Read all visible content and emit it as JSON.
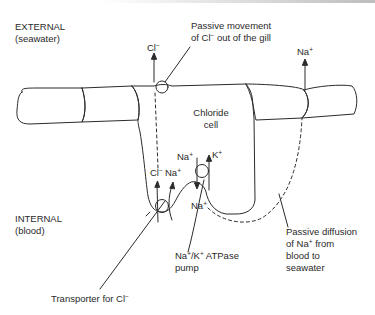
{
  "regions": {
    "external": {
      "title": "EXTERNAL",
      "subtitle": "(seawater)"
    },
    "internal": {
      "title": "INTERNAL",
      "subtitle": "(blood)"
    }
  },
  "cell": {
    "label_line1": "Chloride",
    "label_line2": "cell"
  },
  "ions": {
    "cl_out": {
      "base": "Cl",
      "charge": "−"
    },
    "na_out": {
      "base": "Na",
      "charge": "+"
    },
    "cl_in": {
      "base": "Cl",
      "charge": "−"
    },
    "na_in_co": {
      "base": "Na",
      "charge": "+"
    },
    "na_pump_top": {
      "base": "Na",
      "charge": "+"
    },
    "k_pump": {
      "base": "K",
      "charge": "+"
    },
    "na_pump_bottom": {
      "base": "Na",
      "charge": "+"
    }
  },
  "annotations": {
    "passive_cl": {
      "line1": "Passive movement",
      "line2_pre": "of Cl",
      "line2_charge": "−",
      "line2_post": " out of the gill"
    },
    "pump": {
      "line1_a": "Na",
      "line1_a_charge": "+",
      "line1_sep": "/K",
      "line1_b_charge": "+",
      "line1_post": " ATPase",
      "line2": "pump"
    },
    "passive_na": {
      "line1": "Passive diffusion",
      "line2_pre": "of Na",
      "line2_charge": "+",
      "line2_post": " from",
      "line3": "blood to",
      "line4": "seawater"
    },
    "transporter": {
      "pre": "Transporter for Cl",
      "charge": "−"
    }
  },
  "colors": {
    "line": "#2b2b2b",
    "text": "#2a2a2a",
    "background": "#ffffff"
  }
}
